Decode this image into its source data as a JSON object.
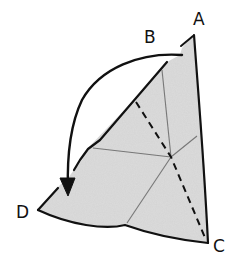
{
  "diagram": {
    "type": "origami-fold-step",
    "points": {
      "A": "A",
      "B": "B",
      "C": "C",
      "D": "D"
    },
    "colors": {
      "paper_fill": "#d9d9d9",
      "line": "#111111",
      "crease": "#8a8a8a",
      "background": "#ffffff"
    },
    "annotations": {
      "arrow": "fold B down to D",
      "dashed_line": "valley fold line from B side to C"
    }
  }
}
